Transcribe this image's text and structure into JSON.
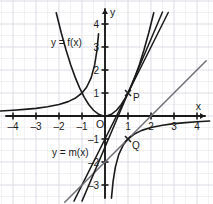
{
  "figure": {
    "background": "#ffffff",
    "grid_color": "#d8d8e2",
    "axis_color": "#1a1a1a",
    "curve_color": "#1a1a1a",
    "secondary_line_color": "#6e6e76",
    "origin_px": [
      105,
      116
    ],
    "unit_px": 23
  },
  "axes": {
    "x_label": "x",
    "y_label": "y",
    "origin_label": "O",
    "x_ticks": [
      {
        "value": -4,
        "label": "–4"
      },
      {
        "value": -3,
        "label": "–3"
      },
      {
        "value": -2,
        "label": "–2"
      },
      {
        "value": -1,
        "label": "–1"
      },
      {
        "value": 1,
        "label": "1"
      },
      {
        "value": 2,
        "label": "2"
      },
      {
        "value": 3,
        "label": "3"
      },
      {
        "value": 4,
        "label": "4"
      }
    ],
    "y_ticks": [
      {
        "value": 4,
        "label": "4"
      },
      {
        "value": 3,
        "label": "3"
      },
      {
        "value": 2,
        "label": "2"
      },
      {
        "value": 1,
        "label": "1"
      },
      {
        "value": -1,
        "label": "–1"
      },
      {
        "value": -2,
        "label": "–2"
      },
      {
        "value": -3,
        "label": "–3"
      }
    ]
  },
  "annotations": {
    "curve_f_label": "y = f(x)",
    "curve_m_label": "y = m(x)",
    "point_p_label": "P",
    "point_q_label": "Q"
  },
  "chart_data": {
    "type": "line",
    "title": "",
    "xlabel": "x",
    "ylabel": "y",
    "xlim": [
      -4.6,
      4.7
    ],
    "ylim": [
      -3.8,
      4.6
    ],
    "grid": true,
    "grid_step": 0.5,
    "legend": "inline-annotations",
    "series": [
      {
        "name": "y = f(x)",
        "kind": "parabola",
        "expression": "x^2",
        "color": "#1a1a1a",
        "x": [
          -2.12,
          -1.9,
          -1.7,
          -1.5,
          -1.3,
          -1.1,
          -0.9,
          -0.7,
          -0.5,
          -0.3,
          -0.1,
          0,
          0.1,
          0.3,
          0.5,
          0.7,
          0.9,
          1.1,
          1.3,
          1.5,
          1.7,
          1.9,
          2.12
        ],
        "y": [
          4.49,
          3.61,
          2.89,
          2.25,
          1.69,
          1.21,
          0.81,
          0.49,
          0.25,
          0.09,
          0.01,
          0,
          0.01,
          0.09,
          0.25,
          0.49,
          0.81,
          1.21,
          1.69,
          2.25,
          2.89,
          3.61,
          4.49
        ]
      },
      {
        "name": "y = m(x) left branch",
        "kind": "hyperbola",
        "expression": "-1/x",
        "color": "#1a1a1a",
        "x": [
          -4.55,
          -4.0,
          -3.5,
          -3.0,
          -2.5,
          -2.0,
          -1.6,
          -1.3,
          -1.0,
          -0.8,
          -0.6,
          -0.45,
          -0.35,
          -0.28
        ],
        "y": [
          0.22,
          0.25,
          0.286,
          0.333,
          0.4,
          0.5,
          0.625,
          0.769,
          1.0,
          1.25,
          1.667,
          2.222,
          2.857,
          3.571
        ]
      },
      {
        "name": "y = m(x) right branch",
        "kind": "hyperbola",
        "expression": "-1/x",
        "color": "#1a1a1a",
        "x": [
          0.28,
          0.35,
          0.45,
          0.6,
          0.8,
          1.0,
          1.3,
          1.6,
          2.0,
          2.5,
          3.0,
          3.5,
          4.0,
          4.55
        ],
        "y": [
          -3.571,
          -2.857,
          -2.222,
          -1.667,
          -1.25,
          -1.0,
          -0.769,
          -0.625,
          -0.5,
          -0.4,
          -0.333,
          -0.286,
          -0.25,
          -0.22
        ]
      },
      {
        "name": "tangent at P",
        "kind": "line",
        "expression": "2x - 1",
        "slope": 2,
        "intercept": -1,
        "color": "#1a1a1a",
        "x": [
          -1.35,
          2.75
        ],
        "y": [
          -3.7,
          4.5
        ]
      },
      {
        "name": "tangent at Q",
        "kind": "line",
        "expression": "x - 2",
        "slope": 1,
        "intercept": -2,
        "color": "#6e6e76",
        "x": [
          -1.75,
          4.4
        ],
        "y": [
          -3.75,
          2.4
        ]
      },
      {
        "name": "secant through P",
        "kind": "line",
        "expression": "2.35x - 1.35",
        "slope": 2.35,
        "intercept": -1.35,
        "color": "#1a1a1a",
        "x": [
          -1.0,
          2.5
        ],
        "y": [
          -3.7,
          4.52
        ]
      }
    ],
    "points": [
      {
        "label": "P",
        "x": 1,
        "y": 1
      },
      {
        "label": "Q",
        "x": 1,
        "y": -1
      }
    ],
    "annotations": [
      {
        "text": "y = f(x)",
        "x": -2.35,
        "y": 3.05
      },
      {
        "text": "y = m(x)",
        "x": -2.3,
        "y": -1.75
      }
    ]
  }
}
